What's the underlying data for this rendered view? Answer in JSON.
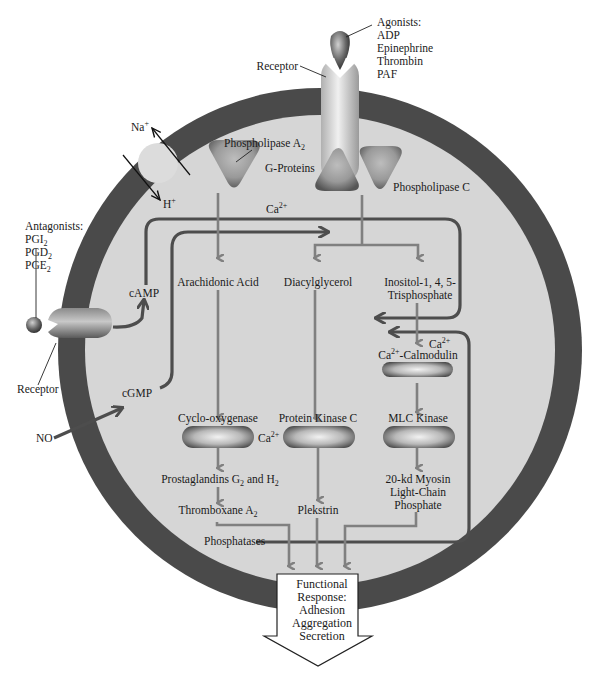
{
  "figure": {
    "colors": {
      "membrane": "#4a4a4a",
      "cytoplasm": "#d6d6d6",
      "pathway_arrow": "#808080",
      "calcium_line": "#4d4d4d",
      "enzyme_dark": "#6e6e6e",
      "background": "#ffffff"
    }
  },
  "agonists": {
    "header": "Agonists:",
    "items": [
      "ADP",
      "Epinephrine",
      "Thrombin",
      "PAF"
    ]
  },
  "antagonists": {
    "header": "Antagonists:",
    "items": [
      {
        "base": "PGI",
        "sub": "2"
      },
      {
        "base": "PGD",
        "sub": "2"
      },
      {
        "base": "PGE",
        "sub": "2"
      }
    ]
  },
  "receptors": {
    "top_label": "Receptor",
    "left_label": "Receptor"
  },
  "exchanger": {
    "na": {
      "base": "Na",
      "sup": "+"
    },
    "h": {
      "base": "H",
      "sup": "+"
    }
  },
  "enzymes": {
    "pla2": {
      "base": "Phospholipase A",
      "sub": "2"
    },
    "g_proteins": "G-Proteins",
    "plc": "Phospholipase C",
    "cox": "Cyclo-oxygenase",
    "pkc": "Protein Kinase C",
    "camod": {
      "pre": "Ca",
      "sup": "2+",
      "post": "-Calmodulin"
    },
    "mlck": "MLC Kinase"
  },
  "second_messengers": {
    "camp": "cAMP",
    "cgmp": "cGMP",
    "no": "NO",
    "ca_top": {
      "base": "Ca",
      "sup": "2+"
    },
    "ca_right": {
      "base": "Ca",
      "sup": "2+"
    },
    "ca_pkc": {
      "base": "Ca",
      "sup": "2+"
    }
  },
  "intermediates": {
    "arachidonic": "Arachidonic Acid",
    "dag": "Diacylglycerol",
    "ip3_line1": "Inositol-1, 4, 5-",
    "ip3_line2": "Trisphosphate",
    "prostaglandins": {
      "pre": "Prostaglandins G",
      "sub1": "2",
      "mid": " and H",
      "sub2": "2"
    },
    "thromboxane": {
      "base": "Thromboxane A",
      "sub": "2"
    },
    "plekstrin": "Plekstrin",
    "myosin_line1": "20-kd Myosin",
    "myosin_line2": "Light-Chain",
    "myosin_line3": "Phosphate",
    "phosphatases": "Phosphatases"
  },
  "response": {
    "lines": [
      "Functional",
      "Response:",
      "Adhesion",
      "Aggregation",
      "Secretion"
    ]
  }
}
